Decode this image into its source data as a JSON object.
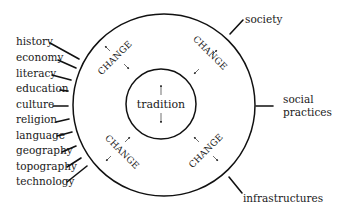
{
  "diagram": {
    "center_label": "tradition",
    "ring_label": "CHANGE",
    "left_labels": [
      {
        "text": "history",
        "x": 16,
        "y": 45,
        "line": [
          50,
          43,
          79,
          59
        ]
      },
      {
        "text": "economy",
        "x": 16,
        "y": 61,
        "line": [
          58,
          60,
          76,
          68
        ]
      },
      {
        "text": "literacy",
        "x": 16,
        "y": 77,
        "line": [
          52,
          75,
          71,
          80
        ]
      },
      {
        "text": "education",
        "x": 16,
        "y": 92,
        "line": [
          60,
          90,
          68,
          91
        ]
      },
      {
        "text": "culture",
        "x": 16,
        "y": 108,
        "line": [
          53,
          106,
          68,
          106
        ]
      },
      {
        "text": "religion",
        "x": 16,
        "y": 123,
        "line": [
          56,
          122,
          69,
          119
        ]
      },
      {
        "text": "language",
        "x": 16,
        "y": 139,
        "line": [
          57,
          136,
          72,
          132
        ]
      },
      {
        "text": "geography",
        "x": 16,
        "y": 154,
        "line": [
          62,
          152,
          76,
          146
        ]
      },
      {
        "text": "topography",
        "x": 16,
        "y": 170,
        "line": [
          67,
          167,
          81,
          158
        ]
      },
      {
        "text": "technology",
        "x": 16,
        "y": 185,
        "line": [
          67,
          182,
          87,
          166
        ]
      }
    ],
    "right_labels": [
      {
        "text": "society",
        "lines": [
          "society"
        ],
        "x": 245,
        "y": 23,
        "line": [
          243,
          20,
          230,
          34
        ]
      },
      {
        "text": "social practices",
        "lines": [
          "social",
          "practices"
        ],
        "x": 283,
        "y": 103,
        "line": [
          256,
          106,
          273,
          106
        ]
      },
      {
        "text": "infrastructures",
        "lines": [
          "infrastructures"
        ],
        "x": 243,
        "y": 202,
        "line": [
          229,
          177,
          242,
          193
        ]
      }
    ]
  }
}
